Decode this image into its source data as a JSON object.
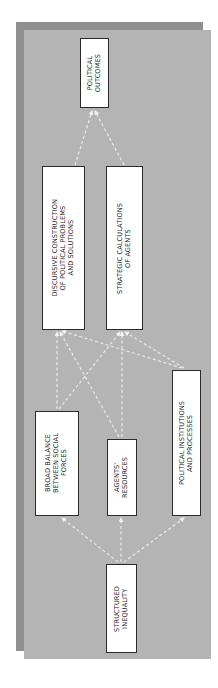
{
  "diagram": {
    "orientation": "rotated-90-ccw",
    "colors": {
      "panel": "#b4b4b4",
      "shadow": "#8f8f8f",
      "node_fill": "#ffffff",
      "node_border": "#2a2a2a",
      "arrow": "#eeeeee"
    },
    "nodes": {
      "political_outcomes": {
        "label": "POLITICAL\nOUTCOMES"
      },
      "discursive_construction": {
        "label": "DISCURSIVE CONSTRUCTION\nOF POLITICAL PROBLEMS\nAND SOLUTIONS"
      },
      "strategic_calculations": {
        "label": "STRATEGIC CALCULATIONS\nOF AGENTS"
      },
      "broad_balance": {
        "label": "BROAD BALANCE\nBETWEEN SOCIAL\nFORCES"
      },
      "agents_resources": {
        "label": "AGENTS'\nRESOURCES"
      },
      "political_institutions": {
        "label": "POLITICAL INSTITUTIONS\nAND PROCESSES"
      },
      "structured_inequality": {
        "label": "STRUCTURED\nINEQUALITY"
      }
    },
    "edges": [
      {
        "from": "structured_inequality",
        "to": "broad_balance"
      },
      {
        "from": "structured_inequality",
        "to": "agents_resources"
      },
      {
        "from": "structured_inequality",
        "to": "political_institutions"
      },
      {
        "from": "broad_balance",
        "to": "discursive_construction"
      },
      {
        "from": "broad_balance",
        "to": "strategic_calculations"
      },
      {
        "from": "agents_resources",
        "to": "discursive_construction"
      },
      {
        "from": "agents_resources",
        "to": "strategic_calculations"
      },
      {
        "from": "political_institutions",
        "to": "discursive_construction"
      },
      {
        "from": "political_institutions",
        "to": "strategic_calculations"
      },
      {
        "from": "discursive_construction",
        "to": "political_outcomes"
      },
      {
        "from": "strategic_calculations",
        "to": "political_outcomes"
      }
    ]
  }
}
